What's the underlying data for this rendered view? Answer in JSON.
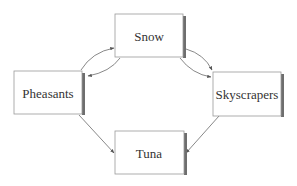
{
  "diagram": {
    "type": "directed-graph",
    "nodes": [
      {
        "id": "snow",
        "label": "Snow",
        "x": 115,
        "y": 14,
        "w": 68,
        "h": 43
      },
      {
        "id": "pheasants",
        "label": "Pheasants",
        "x": 14,
        "y": 71,
        "w": 68,
        "h": 43
      },
      {
        "id": "skyscrapers",
        "label": "Skyscrapers",
        "x": 213,
        "y": 72,
        "w": 68,
        "h": 44
      },
      {
        "id": "tuna",
        "label": "Tuna",
        "x": 115,
        "y": 131,
        "w": 69,
        "h": 43
      }
    ],
    "edges": [
      {
        "from": "pheasants",
        "to": "snow",
        "curved": true
      },
      {
        "from": "snow",
        "to": "pheasants",
        "curved": true
      },
      {
        "from": "snow",
        "to": "skyscrapers",
        "curved": true
      },
      {
        "from": "snow",
        "to": "skyscrapers",
        "curved": true
      },
      {
        "from": "pheasants",
        "to": "tuna",
        "curved": false
      },
      {
        "from": "skyscrapers",
        "to": "tuna",
        "curved": false
      }
    ],
    "colors": {
      "border": "#9a9a9a",
      "shadow": "#6e6e6e",
      "edge": "#555555",
      "text": "#333333"
    }
  }
}
